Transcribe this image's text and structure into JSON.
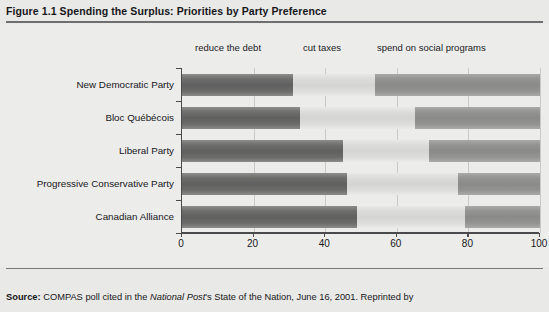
{
  "figure": {
    "number": "Figure 1.1",
    "title": "Spending the Surplus: Priorities by Party Preference",
    "full_title": "Figure 1.1  Spending the Surplus: Priorities by Party Preference"
  },
  "source": {
    "label": "Source:",
    "text_1": " COMPAS poll cited in the ",
    "italic_1": "National Post",
    "text_2": "'s State of the Nation, June 16, 2001. Reprinted by",
    "full": "Source: COMPAS poll cited in the National Post's State of the Nation, June 16, 2001. Reprinted by"
  },
  "chart_data": {
    "type": "bar",
    "orientation": "horizontal",
    "stacked": true,
    "title": "Spending the Surplus: Priorities by Party Preference",
    "xlabel": "",
    "ylabel": "",
    "xlim": [
      0,
      100
    ],
    "xticks": [
      0,
      20,
      40,
      60,
      80,
      100
    ],
    "xtick_labels": [
      "0",
      "20",
      "40",
      "60",
      "80",
      "100"
    ],
    "grid": "vertical",
    "legend_position": "above-plot",
    "categories": [
      "New Democratic Party",
      "Bloc Québécois",
      "Liberal Party",
      "Progressive Conservative Party",
      "Canadian Alliance"
    ],
    "series": [
      {
        "name": "reduce the debt",
        "values": [
          31,
          33,
          45,
          46,
          49
        ]
      },
      {
        "name": "cut taxes",
        "values": [
          23,
          32,
          24,
          31,
          30
        ]
      },
      {
        "name": "spend on social programs",
        "values": [
          46,
          35,
          31,
          23,
          21
        ]
      }
    ],
    "colors": {
      "reduce the debt": "#606060",
      "cut taxes": "#d4d4d2",
      "spend on social programs": "#8a8a88"
    }
  }
}
